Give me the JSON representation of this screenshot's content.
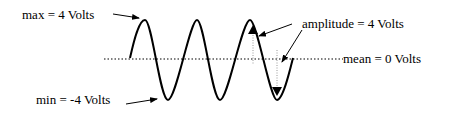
{
  "diagram": {
    "type": "sine-wave-annotation",
    "labels": {
      "max": "max = 4 Volts",
      "min": "min = -4 Volts",
      "amplitude": "amplitude = 4 Volts",
      "mean": "mean = 0 Volts"
    },
    "values": {
      "max_volts": 4,
      "min_volts": -4,
      "amplitude_volts": 4,
      "mean_volts": 0
    },
    "colors": {
      "stroke": "#000000",
      "guide": "#999999",
      "background": "#ffffff"
    }
  }
}
